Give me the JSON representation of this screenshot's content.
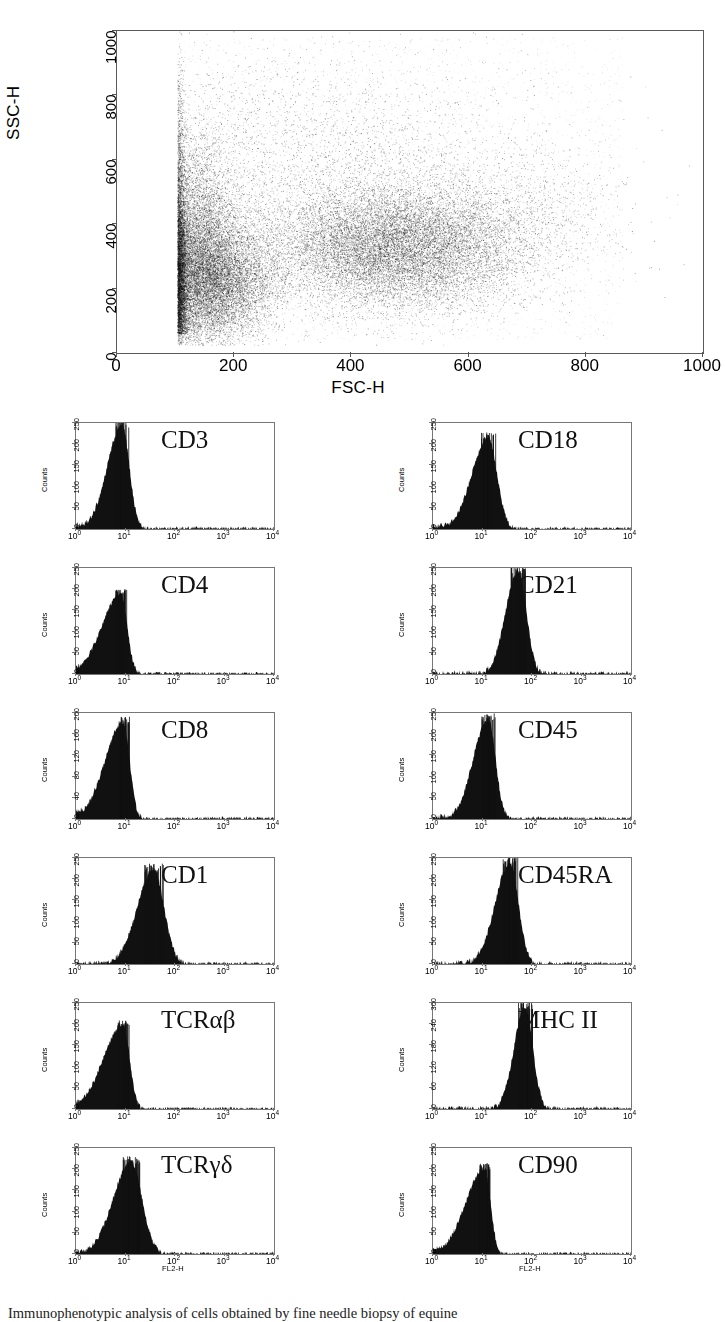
{
  "figure": {
    "type": "flow-cytometry-panel",
    "caption_partial": "Immunophenotypic analysis of cells obtained by fine needle biopsy of equine"
  },
  "scatter": {
    "xlabel": "FSC-H",
    "ylabel": "SSC-H",
    "xticks": [
      "0",
      "200",
      "400",
      "600",
      "800",
      "1000"
    ],
    "yticks": [
      "0",
      "200",
      "400",
      "600",
      "800",
      "1000"
    ],
    "xlim": [
      0,
      1000
    ],
    "ylim": [
      0,
      1000
    ]
  },
  "histogram_axis": {
    "xlabel": "FL2-H",
    "ylabel": "Counts",
    "xticks": [
      "10",
      "10",
      "10",
      "10",
      "10"
    ],
    "xtick_exponents": [
      "0",
      "1",
      "2",
      "3",
      "4"
    ]
  },
  "panels": [
    {
      "marker": "CD3",
      "yticks": [
        "0",
        "50",
        "100",
        "150",
        "200",
        "250"
      ],
      "ymax": 270,
      "peak_x": 8.5,
      "peak_y": 263,
      "sigma_left": 0.3,
      "sigma_right": 0.15,
      "floor_left": 28
    },
    {
      "marker": "CD18",
      "yticks": [
        "0",
        "50",
        "100",
        "150",
        "200",
        "250"
      ],
      "ymax": 270,
      "peak_x": 13.0,
      "peak_y": 232,
      "sigma_left": 0.33,
      "sigma_right": 0.18,
      "floor_left": 22
    },
    {
      "marker": "CD4",
      "yticks": [
        "0",
        "50",
        "100",
        "150",
        "200",
        "250"
      ],
      "ymax": 270,
      "peak_x": 8.0,
      "peak_y": 205,
      "sigma_left": 0.38,
      "sigma_right": 0.13,
      "floor_left": 52
    },
    {
      "marker": "CD21",
      "yticks": [
        "0",
        "50",
        "100",
        "150",
        "200",
        "250"
      ],
      "ymax": 285,
      "peak_x": 52.0,
      "peak_y": 278,
      "sigma_left": 0.25,
      "sigma_right": 0.17,
      "floor_left": 4
    },
    {
      "marker": "CD8",
      "yticks": [
        "0",
        "40",
        "80",
        "120",
        "160",
        "200"
      ],
      "ymax": 215,
      "peak_x": 9.0,
      "peak_y": 196,
      "sigma_left": 0.37,
      "sigma_right": 0.13,
      "floor_left": 45
    },
    {
      "marker": "CD45",
      "yticks": [
        "0",
        "50",
        "100",
        "150",
        "200",
        "250"
      ],
      "ymax": 272,
      "peak_x": 13.0,
      "peak_y": 256,
      "sigma_left": 0.3,
      "sigma_right": 0.15,
      "floor_left": 16
    },
    {
      "marker": "CD1",
      "yticks": [
        "0",
        "50",
        "100",
        "150",
        "200",
        "250"
      ],
      "ymax": 272,
      "peak_x": 37.0,
      "peak_y": 243,
      "sigma_left": 0.33,
      "sigma_right": 0.21,
      "floor_left": 5
    },
    {
      "marker": "CD45RA",
      "yticks": [
        "0",
        "50",
        "100",
        "150",
        "200",
        "250"
      ],
      "ymax": 285,
      "peak_x": 36.0,
      "peak_y": 272,
      "sigma_left": 0.3,
      "sigma_right": 0.17,
      "floor_left": 5
    },
    {
      "marker": "TCRαβ",
      "yticks": [
        "0",
        "50",
        "100",
        "150",
        "200",
        "250"
      ],
      "ymax": 260,
      "peak_x": 9.0,
      "peak_y": 207,
      "sigma_left": 0.4,
      "sigma_right": 0.13,
      "floor_left": 48
    },
    {
      "marker": "MHC II",
      "yticks": [
        "0",
        "60",
        "120",
        "180",
        "240",
        "300"
      ],
      "ymax": 320,
      "peak_x": 72.0,
      "peak_y": 308,
      "sigma_left": 0.22,
      "sigma_right": 0.16,
      "floor_left": 3
    },
    {
      "marker": "TCRγδ",
      "yticks": [
        "0",
        "50",
        "100",
        "150",
        "200",
        "250"
      ],
      "ymax": 265,
      "peak_x": 13.0,
      "peak_y": 231,
      "sigma_left": 0.36,
      "sigma_right": 0.22,
      "floor_left": 18
    },
    {
      "marker": "CD90",
      "yticks": [
        "0",
        "50",
        "100",
        "150",
        "200",
        "250"
      ],
      "ymax": 262,
      "peak_x": 11.0,
      "peak_y": 212,
      "sigma_left": 0.38,
      "sigma_right": 0.12,
      "floor_left": 38
    }
  ],
  "chart_data": {
    "type": "scatter",
    "title": "",
    "xlabel": "FSC-H",
    "ylabel": "SSC-H",
    "xlim": [
      0,
      1000
    ],
    "ylim": [
      0,
      1000
    ],
    "grid": false,
    "legend": "none",
    "clusters": [
      {
        "name": "lymphocytes",
        "cx": 165,
        "cy": 230,
        "sx": 55,
        "sy": 95,
        "n": 9000
      },
      {
        "name": "small-cells-left-edge",
        "cx": 135,
        "cy": 330,
        "sx": 35,
        "sy": 170,
        "n": 6500
      },
      {
        "name": "granulocytes-monocytes",
        "cx": 470,
        "cy": 330,
        "sx": 105,
        "sy": 95,
        "n": 14000
      },
      {
        "name": "diffuse-upper",
        "cx": 330,
        "cy": 600,
        "sx": 190,
        "sy": 180,
        "n": 3500
      },
      {
        "name": "right-tail",
        "cx": 680,
        "cy": 420,
        "sx": 90,
        "sy": 120,
        "n": 1200
      }
    ]
  }
}
